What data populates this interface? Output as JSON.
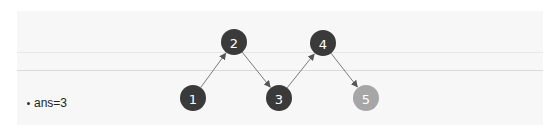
{
  "diagram": {
    "title": "",
    "colors": {
      "node_dark": "#3a3a3a",
      "node_highlight": "#a6a6a6",
      "edge": "#7a7a7a",
      "label": "#ffffff",
      "panel_bg": "#f7f7f7"
    },
    "nodes": [
      {
        "id": "1",
        "label": "1",
        "x": 193,
        "y": 98,
        "state": "dark"
      },
      {
        "id": "2",
        "label": "2",
        "x": 234,
        "y": 42,
        "state": "dark"
      },
      {
        "id": "3",
        "label": "3",
        "x": 279,
        "y": 98,
        "state": "dark"
      },
      {
        "id": "4",
        "label": "4",
        "x": 323,
        "y": 43,
        "state": "dark"
      },
      {
        "id": "5",
        "label": "5",
        "x": 366,
        "y": 98,
        "state": "highlight"
      }
    ],
    "edges": [
      {
        "from": "1",
        "to": "2"
      },
      {
        "from": "2",
        "to": "3"
      },
      {
        "from": "3",
        "to": "4"
      },
      {
        "from": "4",
        "to": "5"
      }
    ]
  },
  "caption": {
    "bullet": "•",
    "text": "ans=3"
  }
}
